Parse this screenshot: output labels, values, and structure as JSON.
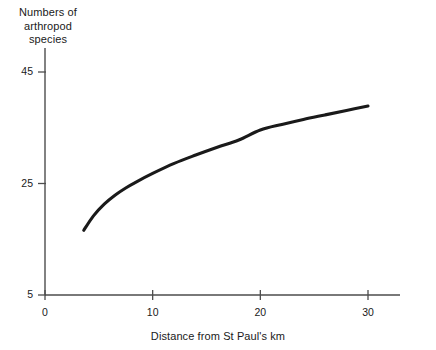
{
  "chart_data": {
    "type": "line",
    "title": "",
    "xlabel": "Distance from St Paul's km",
    "ylabel_lines": [
      "Numbers of",
      "arthropod",
      "species"
    ],
    "ylabel": "Numbers of arthropod species",
    "xlim": [
      0,
      33
    ],
    "ylim": [
      5,
      47
    ],
    "grid": false,
    "legend": null,
    "xticks": [
      {
        "value": 0,
        "label": "0"
      },
      {
        "value": 10,
        "label": "10"
      },
      {
        "value": 20,
        "label": "20"
      },
      {
        "value": 30,
        "label": "30"
      }
    ],
    "yticks": [
      {
        "value": 5,
        "label": "5"
      },
      {
        "value": 25,
        "label": "25"
      },
      {
        "value": 45,
        "label": "45"
      }
    ],
    "series": [
      {
        "name": "arthropod species",
        "color": "#1a1a1a",
        "x": [
          3.6,
          4.5,
          5.5,
          6.5,
          7.5,
          8.5,
          10.0,
          12.0,
          14.0,
          16.0,
          18.0,
          20.0,
          22.0,
          24.0,
          26.0,
          28.0,
          30.0
        ],
        "y": [
          16.6,
          19.2,
          21.3,
          22.9,
          24.2,
          25.3,
          26.8,
          28.6,
          30.1,
          31.5,
          32.8,
          34.6,
          35.6,
          36.5,
          37.3,
          38.1,
          38.9
        ]
      }
    ]
  },
  "axes": {
    "x_axis_name": "x-axis",
    "y_axis_name": "y-axis"
  }
}
